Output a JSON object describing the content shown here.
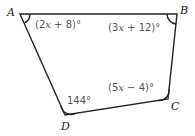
{
  "diagram": {
    "type": "quadrilateral",
    "vertices": [
      {
        "name": "A",
        "x": 20,
        "y": 14
      },
      {
        "name": "B",
        "x": 177,
        "y": 14
      },
      {
        "name": "C",
        "x": 168,
        "y": 99
      },
      {
        "name": "D",
        "x": 65,
        "y": 115
      }
    ],
    "angles": {
      "A": {
        "pre": "(2",
        "var": "x",
        "post": " + 8)°"
      },
      "B": {
        "pre": "(3",
        "var": "x",
        "post": " + 12)°"
      },
      "C": {
        "pre": "(5",
        "var": "x",
        "post": " − 4)°"
      },
      "D": {
        "text": "144°"
      }
    }
  }
}
